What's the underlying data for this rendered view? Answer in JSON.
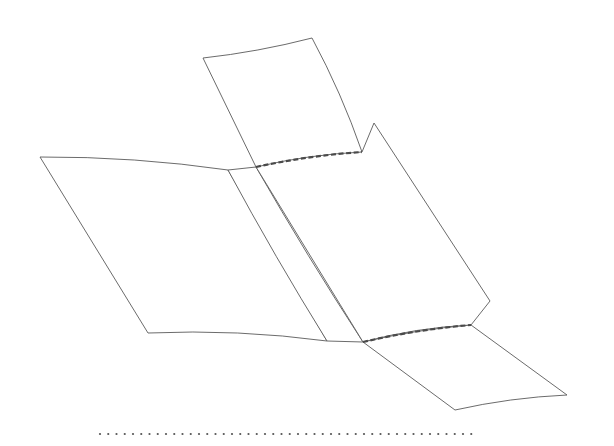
{
  "figure": {
    "background_color": "#ffffff",
    "width": 614,
    "height": 446,
    "stroke_color": "#5a5a5a",
    "fold_crease_color": "#4a4a4a",
    "baseline_color": "#555555",
    "facet_fill": "#ffffff",
    "stroke_width": 0.9,
    "crease_stroke_width": 2.2,
    "baseline_dot_radius": 1.1
  },
  "chart_data": {
    "type": "diagram",
    "xlabel": "",
    "ylabel": "",
    "xlim": [
      0,
      614
    ],
    "ylim": [
      0,
      446
    ],
    "grid": false,
    "legend": "none",
    "annotations": [],
    "elements": [
      {
        "name": "upper-flap",
        "kind": "facet",
        "closed": true,
        "points": [
          [
            203,
            58
          ],
          [
            312,
            38
          ],
          [
            362,
            152
          ],
          [
            256,
            167
          ]
        ],
        "edge_style": "solid"
      },
      {
        "name": "left-panel",
        "kind": "facet",
        "closed": true,
        "points": [
          [
            40,
            157
          ],
          [
            228,
            170
          ],
          [
            327,
            341
          ],
          [
            148,
            333
          ]
        ],
        "edge_style": "solid"
      },
      {
        "name": "center-panel",
        "kind": "facet",
        "closed": true,
        "points": [
          [
            228,
            170
          ],
          [
            256,
            167
          ],
          [
            363,
            342
          ],
          [
            327,
            341
          ]
        ],
        "edge_style": "solid"
      },
      {
        "name": "right-panel",
        "kind": "facet",
        "closed": true,
        "points": [
          [
            256,
            167
          ],
          [
            362,
            152
          ],
          [
            374,
            123
          ],
          [
            490,
            301
          ],
          [
            471,
            325
          ],
          [
            363,
            342
          ]
        ],
        "edge_style": "solid"
      },
      {
        "name": "lower-flap",
        "kind": "facet",
        "closed": true,
        "points": [
          [
            363,
            342
          ],
          [
            471,
            325
          ],
          [
            567,
            395
          ],
          [
            455,
            410
          ]
        ],
        "edge_style": "solid"
      },
      {
        "name": "upper-fold-crease",
        "kind": "crease",
        "closed": false,
        "points": [
          [
            256,
            167
          ],
          [
            362,
            152
          ]
        ],
        "edge_style": "dashed"
      },
      {
        "name": "lower-fold-crease",
        "kind": "crease",
        "closed": false,
        "points": [
          [
            363,
            342
          ],
          [
            471,
            325
          ]
        ],
        "edge_style": "dashed"
      },
      {
        "name": "reference-baseline",
        "kind": "baseline",
        "closed": false,
        "points": [
          [
            100,
            434
          ],
          [
            476,
            434
          ]
        ],
        "edge_style": "dotted"
      }
    ]
  }
}
